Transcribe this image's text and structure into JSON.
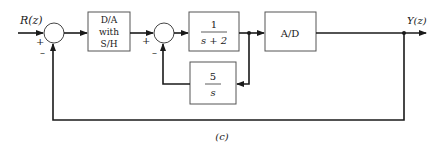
{
  "diagram": {
    "type": "block-diagram",
    "caption": "(c)",
    "input_label": "R(z)",
    "output_label": "Y(z)",
    "summing_junctions": [
      {
        "id": "sum1",
        "plus_sign": "+",
        "minus_sign": "–"
      },
      {
        "id": "sum2",
        "plus_sign": "+",
        "minus_sign": "–"
      }
    ],
    "blocks": [
      {
        "id": "da",
        "lines": [
          "D/A",
          "with",
          "S/H"
        ]
      },
      {
        "id": "plant",
        "numerator": "1",
        "denominator": "s + 2"
      },
      {
        "id": "ad",
        "label": "A/D"
      },
      {
        "id": "feedback",
        "numerator": "5",
        "denominator": "s"
      }
    ]
  }
}
